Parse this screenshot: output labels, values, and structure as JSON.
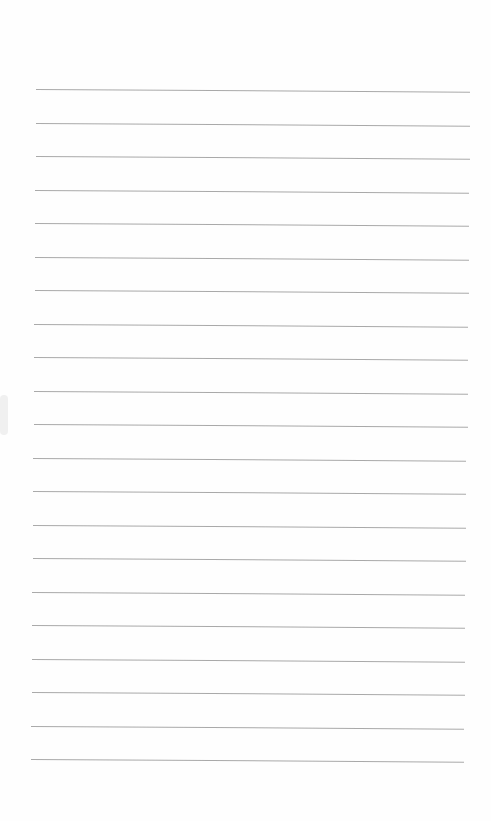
{
  "page": {
    "type": "lined-paper",
    "background": "#fefefe",
    "line_color": "#9a9a9a",
    "line_count": 21,
    "first_line_y": 89,
    "line_spacing": 33.5,
    "left_top": 36,
    "right_top": 470,
    "left_bottom": 31,
    "right_bottom": 464,
    "tilt_deg": 0.35,
    "text": ""
  }
}
